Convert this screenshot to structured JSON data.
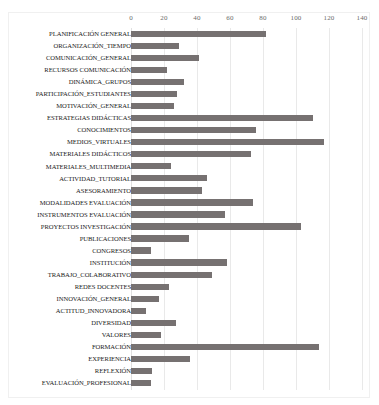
{
  "chart_data": {
    "type": "bar",
    "orientation": "horizontal",
    "title": "",
    "subtitle": "",
    "xlabel": "",
    "ylabel": "",
    "xlim": [
      0,
      140
    ],
    "xticks": [
      0,
      20,
      40,
      60,
      80,
      100,
      120,
      140
    ],
    "xtick_labels": [
      "0",
      "20",
      "40",
      "60",
      "80",
      "100",
      "120",
      "140"
    ],
    "grid": "vertical",
    "legend": "none",
    "bar_color": "#767171",
    "categories": [
      "PLANIFICACIÓN GENERAL",
      "ORGANIZACIÓN_TIEMPO",
      "COMUNICACIÓN_GENERAL",
      "RECURSOS COMUNICACIÓN",
      "DINÁMICA_GRUPOS",
      "PARTICIPACIÓN_ESTUDIANTES",
      "MOTIVACIÓN_GENERAL",
      "ESTRATEGIAS DIDÁCTICAS",
      "CONOCIMIENTOS",
      "MEDIOS_VIRTUALES",
      "MATERIALES DIDÁCTICOS",
      "MATERIALES_MULTIMEDIA",
      "ACTIVIDAD_TUTORIAL",
      "ASESORAMIENTO",
      "MODALIDADES EVALUACIÓN",
      "INSTRUMENTOS EVALUACIÓN",
      "PROYECTOS INVESTIGACIÓN",
      "PUBLICACIONES",
      "CONGRESOS",
      "INSTITUCIÓN",
      "TRABAJO_COLABORATIVO",
      "REDES DOCENTES",
      "INNOVACIÓN_GENERAL",
      "ACTITUD_INNOVADORA",
      "DIVERSIDAD",
      "VALORES",
      "FORMACIÓN",
      "EXPERIENCIA",
      "REFLEXIÓN",
      "EVALUACIÓN_PROFESIONAL"
    ],
    "values": [
      82,
      29,
      41,
      22,
      32,
      28,
      26,
      110,
      76,
      117,
      73,
      24,
      46,
      43,
      74,
      57,
      103,
      35,
      12,
      58,
      49,
      23,
      17,
      9,
      27,
      18,
      114,
      36,
      13,
      12
    ]
  }
}
